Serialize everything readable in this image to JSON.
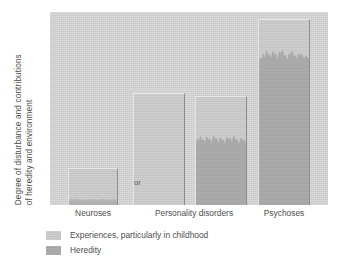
{
  "chart_data": {
    "type": "bar",
    "title": "",
    "subtitle": "",
    "xlabel": "",
    "ylabel_line_1": "Degree of disturbance and contributions",
    "ylabel_line_2": "of heredity and environment",
    "grid": false,
    "legend_position": "below-axis-left",
    "ylim": [
      0,
      100
    ],
    "y_axis_ticks": [],
    "categories": [
      "Neuroses",
      "Personality disorders",
      "Psychoses"
    ],
    "bars": [
      {
        "id": "neuroses",
        "category": "Neuroses",
        "total": 18,
        "heredity": 2,
        "experiences": 16,
        "transition": "soft"
      },
      {
        "id": "personality-disorders-a",
        "category": "Personality disorders",
        "total": 54,
        "heredity": 0,
        "experiences": 54,
        "transition": "none"
      },
      {
        "id": "personality-disorders-b",
        "category": "Personality disorders",
        "total": 53,
        "heredity": 26,
        "experiences": 27,
        "transition": "jagged"
      },
      {
        "id": "psychoses",
        "category": "Psychoses",
        "total": 90,
        "heredity": 66,
        "experiences": 24,
        "transition": "jagged"
      }
    ],
    "annotations": [
      {
        "id": "or-separator",
        "text": "or"
      }
    ],
    "legend": [
      {
        "label": "Experiences, particularly in childhood",
        "color": "#cbcbcb"
      },
      {
        "label": "Heredity",
        "color": "#a9a9a9"
      }
    ],
    "colors": {
      "plot_background": "#d7d7d7",
      "experiences": "#cbcbcb",
      "heredity": "#a9a9a9",
      "bar_highlight": "#e8e8e8",
      "bar_shadow": "#8c8c8c",
      "text": "#4d4d4d",
      "figure_background": "#ffffff"
    }
  }
}
